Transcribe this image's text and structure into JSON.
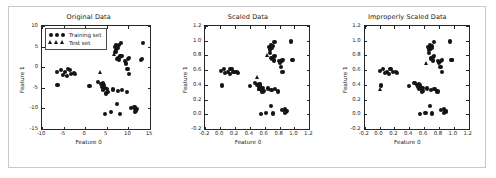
{
  "figure": {
    "background": "#ffffff",
    "border_color": "#c9c9c9",
    "marker_color": "#141414",
    "axis_color": "#262626"
  },
  "legend": {
    "training_label": "Training set",
    "test_label": "Test set",
    "training_marker": "circle-marker",
    "test_marker": "triangle-marker"
  },
  "chart_data": [
    {
      "type": "scatter",
      "title": "Original Data",
      "xlabel": "Feature 0",
      "ylabel": "Feature 1",
      "xlim": [
        -10,
        15
      ],
      "ylim": [
        -15,
        10
      ],
      "xticks": [
        -10,
        -5,
        0,
        5,
        10,
        15
      ],
      "yticks": [
        -15,
        -10,
        -5,
        0,
        5,
        10
      ],
      "xticklabels": [
        "-10",
        "-5",
        "0",
        "5",
        "10",
        "15"
      ],
      "yticklabels": [
        "-15",
        "-10",
        "-5",
        "0",
        "5",
        "10"
      ],
      "grid": false,
      "legend_position": "upper left",
      "series": [
        {
          "name": "Training set",
          "marker": "circle",
          "x": [
            -6.5,
            -5.6,
            -5.2,
            -4.6,
            -4.2,
            -3.9,
            -3.5,
            -3.2,
            -2.6,
            -2.3,
            -6.4,
            1.0,
            2.9,
            3.6,
            3.9,
            4.2,
            4.3,
            4.5,
            4.1,
            5.0,
            5.2,
            4.9,
            6.4,
            7.6,
            4.6,
            5.9,
            7.3,
            8.0,
            8.6,
            9.6,
            10.6,
            11.4,
            11.6,
            11.8,
            11.5,
            12.0,
            6.9,
            7.2,
            7.5,
            7.8,
            7.1,
            8.3,
            7.4,
            7.9,
            9.2,
            9.5,
            9.8,
            10.2,
            9.9,
            10.1,
            12.9,
            13.2,
            13.4,
            7.0,
            7.6,
            8.1,
            8.4
          ],
          "y": [
            -1.2,
            -0.6,
            -1.9,
            -1.1,
            -2.1,
            -0.4,
            -0.6,
            -1.6,
            -1.5,
            -1.7,
            -4.3,
            -4.5,
            -3.6,
            -4.1,
            -4.9,
            -3.8,
            -4.4,
            -5.1,
            -5.6,
            -5.2,
            -6.0,
            -6.4,
            -5.4,
            -5.8,
            -11.4,
            -10.9,
            -8.9,
            -11.3,
            -5.5,
            -6.1,
            -9.9,
            -9.6,
            -10.2,
            -10.5,
            -10.8,
            -10.1,
            5.0,
            5.4,
            4.6,
            5.3,
            4.2,
            5.9,
            2.0,
            1.7,
            1.5,
            0.9,
            -0.4,
            -1.7,
            1.9,
            2.2,
            1.7,
            1.9,
            5.9,
            3.6,
            2.3,
            2.6,
            2.8
          ]
        },
        {
          "name": "Test set",
          "marker": "triangle",
          "x": [
            4.2,
            3.6,
            6.8
          ],
          "y": [
            -5.4,
            -1.4,
            3.1
          ]
        }
      ]
    },
    {
      "type": "scatter",
      "title": "Scaled Data",
      "xlabel": "Feature 0",
      "ylabel": "Feature 1",
      "xlim": [
        -0.2,
        1.2
      ],
      "ylim": [
        -0.2,
        1.2
      ],
      "xticks": [
        -0.2,
        0.0,
        0.2,
        0.4,
        0.6,
        0.8,
        1.0,
        1.2
      ],
      "yticks": [
        -0.2,
        0.0,
        0.2,
        0.4,
        0.6,
        0.8,
        1.0,
        1.2
      ],
      "xticklabels": [
        "-0.2",
        "0.0",
        "0.2",
        "0.4",
        "0.6",
        "0.8",
        "1.0",
        "1.2"
      ],
      "yticklabels": [
        "-0.2",
        "0.0",
        "0.2",
        "0.4",
        "0.6",
        "0.8",
        "1.0",
        "1.2"
      ],
      "grid": false,
      "legend_position": "none",
      "series": [
        {
          "name": "Training set",
          "marker": "circle",
          "x": [
            0.01,
            0.05,
            0.07,
            0.1,
            0.13,
            0.14,
            0.16,
            0.18,
            0.22,
            0.24,
            0.02,
            0.4,
            0.47,
            0.5,
            0.52,
            0.53,
            0.54,
            0.55,
            0.53,
            0.58,
            0.59,
            0.57,
            0.64,
            0.69,
            0.55,
            0.62,
            0.68,
            0.71,
            0.74,
            0.78,
            0.83,
            0.87,
            0.88,
            0.89,
            0.87,
            0.9,
            0.66,
            0.68,
            0.7,
            0.71,
            0.67,
            0.73,
            0.7,
            0.72,
            0.79,
            0.8,
            0.82,
            0.84,
            0.83,
            0.84,
            0.95,
            0.97,
            0.98,
            0.67,
            0.69,
            0.72,
            0.73
          ],
          "y": [
            0.59,
            0.61,
            0.56,
            0.58,
            0.55,
            0.62,
            0.61,
            0.57,
            0.57,
            0.56,
            0.39,
            0.38,
            0.42,
            0.4,
            0.37,
            0.41,
            0.39,
            0.36,
            0.34,
            0.36,
            0.32,
            0.31,
            0.35,
            0.33,
            0.0,
            0.02,
            0.11,
            0.01,
            0.34,
            0.31,
            0.06,
            0.07,
            0.04,
            0.03,
            0.02,
            0.05,
            0.92,
            0.94,
            0.9,
            0.93,
            0.88,
            0.98,
            0.75,
            0.73,
            0.72,
            0.7,
            0.64,
            0.57,
            0.72,
            0.74,
            0.99,
            0.74,
            0.74,
            0.83,
            0.77,
            0.78,
            0.79
          ]
        },
        {
          "name": "Test set",
          "marker": "triangle",
          "x": [
            0.53,
            0.5,
            0.64
          ],
          "y": [
            0.34,
            0.5,
            0.8
          ]
        }
      ]
    },
    {
      "type": "scatter",
      "title": "Improperly Scaled Data",
      "xlabel": "Feature 0",
      "ylabel": "Feature 1",
      "xlim": [
        -0.2,
        1.2
      ],
      "ylim": [
        -0.2,
        1.2
      ],
      "xticks": [
        -0.2,
        0.0,
        0.2,
        0.4,
        0.6,
        0.8,
        1.0,
        1.2
      ],
      "yticks": [
        -0.2,
        0.0,
        0.2,
        0.4,
        0.6,
        0.8,
        1.0,
        1.2
      ],
      "xticklabels": [
        "-0.2",
        "0.0",
        "0.2",
        "0.4",
        "0.6",
        "0.8",
        "1.0",
        "1.2"
      ],
      "yticklabels": [
        "-0.2",
        "0.0",
        "0.2",
        "0.4",
        "0.6",
        "0.8",
        "1.0",
        "1.2"
      ],
      "grid": false,
      "legend_position": "none",
      "series": [
        {
          "name": "Training set",
          "marker": "circle",
          "x": [
            0.01,
            0.05,
            0.07,
            0.1,
            0.13,
            0.14,
            0.16,
            0.18,
            0.22,
            0.24,
            0.02,
            0.4,
            0.47,
            0.5,
            0.52,
            0.53,
            0.54,
            0.55,
            0.53,
            0.58,
            0.59,
            0.57,
            0.64,
            0.69,
            0.55,
            0.62,
            0.68,
            0.71,
            0.74,
            0.78,
            0.83,
            0.87,
            0.88,
            0.89,
            0.87,
            0.9,
            0.66,
            0.68,
            0.7,
            0.71,
            0.67,
            0.73,
            0.7,
            0.72,
            0.79,
            0.8,
            0.82,
            0.84,
            0.83,
            0.84,
            0.95,
            0.97,
            0.98,
            0.67,
            0.69,
            0.72,
            0.73
          ],
          "y": [
            0.59,
            0.61,
            0.56,
            0.58,
            0.55,
            0.62,
            0.61,
            0.57,
            0.57,
            0.56,
            0.39,
            0.38,
            0.42,
            0.4,
            0.37,
            0.41,
            0.39,
            0.36,
            0.34,
            0.36,
            0.32,
            0.31,
            0.35,
            0.33,
            0.0,
            0.02,
            0.11,
            0.01,
            0.34,
            0.31,
            0.06,
            0.07,
            0.04,
            0.03,
            0.02,
            0.05,
            0.92,
            0.94,
            0.9,
            0.93,
            0.88,
            0.98,
            0.75,
            0.73,
            0.72,
            0.7,
            0.64,
            0.57,
            0.72,
            0.74,
            0.99,
            0.74,
            0.74,
            0.83,
            0.77,
            0.78,
            0.79
          ]
        },
        {
          "name": "Test set",
          "marker": "triangle",
          "x": [
            0.01,
            0.63,
            0.69
          ],
          "y": [
            0.33,
            0.69,
            0.88
          ]
        }
      ]
    }
  ]
}
